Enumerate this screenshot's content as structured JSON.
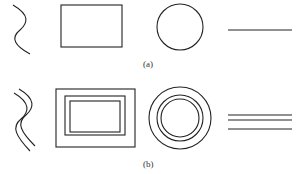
{
  "figure": {
    "labels": {
      "a": "(a)",
      "b": "(b)"
    },
    "row_a": {
      "shapes": [
        "wavy-line",
        "rectangle",
        "circle",
        "straight-line"
      ]
    },
    "row_b": {
      "shapes": [
        "double-wavy-line",
        "nested-rectangles",
        "concentric-circles",
        "triple-lines"
      ]
    },
    "stroke_color": "#222222"
  }
}
